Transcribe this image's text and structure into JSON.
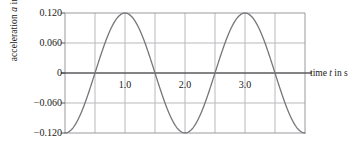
{
  "figure": {
    "kind": "physics-acceleration-vs-time-graph"
  },
  "axes": {
    "y_label_prefix": "acceleration ",
    "y_label_symbol": "a",
    "y_label_suffix": " in m/s",
    "y_label_exponent": "2",
    "x_label_prefix": "time ",
    "x_label_symbol": "t",
    "x_label_suffix": " in s",
    "y_ticks": [
      "0.120",
      "0.060",
      "0",
      "−0.060",
      "−0.120"
    ],
    "x_ticks": [
      "1.0",
      "2.0",
      "3.0"
    ]
  },
  "style": {
    "curve_color": "#76767a",
    "grid_color": "#b9b9bd",
    "frame_color": "#9a9a9e",
    "axis_color": "#5a5a5e",
    "text_color": "#1a1a1a",
    "background": "#ffffff"
  },
  "chart_data": {
    "type": "line",
    "title": "",
    "xlabel": "time t in s",
    "ylabel": "acceleration a in m/s^2",
    "xlim": [
      0.0,
      4.0
    ],
    "ylim": [
      -0.12,
      0.12
    ],
    "grid": true,
    "legend": "none",
    "x_tick_values": [
      1.0,
      2.0,
      3.0
    ],
    "x_tick_labels": [
      "1.0",
      "2.0",
      "3.0"
    ],
    "x_gridline_values": [
      0.5,
      1.0,
      1.5,
      2.0,
      2.5,
      3.0,
      3.5
    ],
    "y_tick_values": [
      0.12,
      0.06,
      0,
      -0.06,
      -0.12
    ],
    "y_tick_labels": [
      "0.120",
      "0.060",
      "0",
      "−0.060",
      "−0.120"
    ],
    "y_gridline_values": [
      0.06,
      -0.06
    ],
    "function": "a(t) = -0.120 * cos(pi * t)",
    "amplitude": 0.12,
    "period": 2.0,
    "units": {
      "x": "s",
      "y": "m/s^2"
    },
    "series": [
      {
        "name": "acceleration",
        "x": [
          0.0,
          0.1,
          0.2,
          0.3,
          0.4,
          0.5,
          0.6,
          0.7,
          0.8,
          0.9,
          1.0,
          1.1,
          1.2,
          1.3,
          1.4,
          1.5,
          1.6,
          1.7,
          1.8,
          1.9,
          2.0,
          2.1,
          2.2,
          2.3,
          2.4,
          2.5,
          2.6,
          2.7,
          2.8,
          2.9,
          3.0,
          3.1,
          3.2,
          3.3,
          3.4,
          3.5,
          3.6,
          3.7,
          3.8,
          3.9,
          4.0
        ],
        "y": [
          -0.12,
          -0.114,
          -0.097,
          -0.071,
          -0.037,
          0.0,
          0.037,
          0.071,
          0.097,
          0.114,
          0.12,
          0.114,
          0.097,
          0.071,
          0.037,
          0.0,
          -0.037,
          -0.071,
          -0.097,
          -0.114,
          -0.12,
          -0.114,
          -0.097,
          -0.071,
          -0.037,
          0.0,
          0.037,
          0.071,
          0.097,
          0.114,
          0.12,
          0.114,
          0.097,
          0.071,
          0.037,
          0.0,
          -0.037,
          -0.071,
          -0.097,
          -0.114,
          -0.12
        ]
      }
    ],
    "key_points": {
      "maxima_t": [
        1.0,
        3.0
      ],
      "maxima_a": 0.12,
      "minima_t": [
        0.0,
        2.0,
        4.0
      ],
      "minima_a": -0.12,
      "zero_crossings_t": [
        0.5,
        1.5,
        2.5,
        3.5
      ]
    }
  }
}
